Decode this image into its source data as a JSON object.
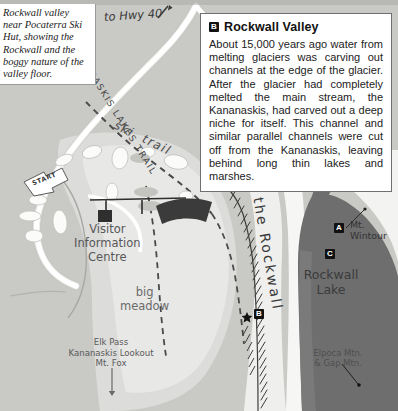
{
  "caption": {
    "text": "Rockwall valley near Pocaterra Ski Hut, showing the Rockwall and the boggy nature of the valley floor."
  },
  "infobox": {
    "marker": "B",
    "title": "Rockwall Valley",
    "body": "About 15,000 years ago water from melting glaciers was carving out channels at the edge of the glacier. After the glacier had completely melted the main stream, the Kananaskis, had carved out a deep niche for itself. This channel and similar parallel channels were cut off from the Kananaskis, leaving behind long thin lakes and marshes."
  },
  "map": {
    "labels": {
      "highway": "to Hwy 40",
      "kananaskis_lakes_trail": "KANANASKIS LAKES TRAIL",
      "ski_trail": "ski  trail",
      "visitor_centre": "Visitor\nInformation\nCentre",
      "big_meadow": "big\nmeadow",
      "elk_pass": "Elk Pass\nKananaskis Lookout\nMt. Fox",
      "the_rockwall": "the Rockwall",
      "mt_wintour": "Mt.\nWintour",
      "rockwall_lake": "Rockwall\nLake",
      "elpoca": "Elpoca Mtn.\n& Gap Mtn.",
      "start": "START"
    },
    "markers": {
      "a": "A",
      "b": "B",
      "c": "C"
    },
    "colors": {
      "background": "#c9c9c6",
      "meadow": "#dedede",
      "pale": "#efefee",
      "road": "#f4f4f2",
      "lake": "#6f6f6f",
      "building": "#3b3b3b",
      "ink": "#3c3c3c"
    }
  }
}
